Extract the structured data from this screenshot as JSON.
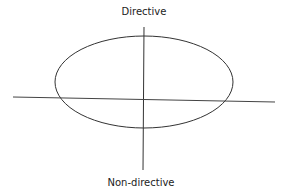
{
  "diagram": {
    "labels": {
      "top": "Directive",
      "bottom": "Non-directive"
    },
    "colors": {
      "line": "#333333",
      "background": "#ffffff"
    }
  }
}
